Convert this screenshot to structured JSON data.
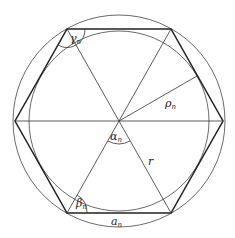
{
  "diagram": {
    "type": "regular-hexagon-inscribed-circumscribed",
    "labels": {
      "gamma": "γ",
      "gamma_sub": "n",
      "rho": "ρ",
      "rho_sub": "n",
      "alpha": "α",
      "alpha_sub": "n",
      "r": "r",
      "beta": "β",
      "beta_sub": "n",
      "a": "a",
      "a_sub": "n"
    },
    "colors": {
      "stroke": "#333333",
      "background": "#ffffff"
    }
  }
}
